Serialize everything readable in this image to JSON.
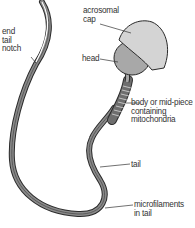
{
  "labels": {
    "end_tail": [
      "end",
      "tail",
      "notch"
    ],
    "acrosomal": [
      "acrosomal",
      "cap"
    ],
    "head": "head",
    "body": [
      "body or mid-piece",
      "containing",
      "mitochondria"
    ],
    "tail": "tail",
    "microfilaments": [
      "microfilaments",
      "in tail"
    ]
  },
  "colors": {
    "cap": "#d4d4d4",
    "head": "#a8a8a8",
    "outline": "#2a2a2a",
    "tail": "#7a7a7a",
    "midpiece": "#6e6e6e"
  }
}
